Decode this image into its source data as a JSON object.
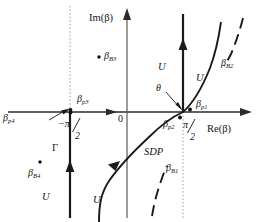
{
  "figure": {
    "axes": {
      "x_label": "Re(β)",
      "y_label": "Im(β)",
      "origin_label": "0"
    },
    "ticks": [
      {
        "name": "minus-pi-over-2",
        "numerator": "−π",
        "slash": "∕",
        "denominator": "2",
        "x": 70,
        "y": 112
      },
      {
        "name": "pi-over-2",
        "numerator": "π",
        "slash": "∕",
        "denominator": "2",
        "x": 183,
        "y": 112
      }
    ],
    "angle_label": "θ",
    "contour_label": "Γ",
    "sdp_label": "SDP",
    "u_labels": [
      {
        "id": "u-upper-left-of-vertical",
        "text": "U",
        "x": 158,
        "y": 55
      },
      {
        "id": "u-right-of-vertical",
        "text": "U",
        "x": 196,
        "y": 73
      },
      {
        "id": "u-lower-left",
        "text": "U",
        "x": 42,
        "y": 197
      },
      {
        "id": "u-lower-right-of-contour",
        "text": "U",
        "x": 93,
        "y": 200
      }
    ],
    "poles": [
      {
        "id": "beta-p1",
        "base": "β",
        "sub": "p1",
        "x": 196,
        "y": 106,
        "dot_x": 189,
        "dot_y": 110
      },
      {
        "id": "beta-p2",
        "base": "β",
        "sub": "p2",
        "x": 165,
        "y": 126,
        "dot_x": 180,
        "dot_y": 117
      },
      {
        "id": "beta-p3",
        "base": "β",
        "sub": "p3",
        "x": 79,
        "y": 101,
        "dot_x": 69,
        "dot_y": 110
      },
      {
        "id": "beta-p4",
        "base": "β",
        "sub": "p4",
        "x": 5,
        "y": 117,
        "dot_x": 70,
        "dot_y": 112
      }
    ],
    "branch_points": [
      {
        "id": "beta-B1",
        "base": "β",
        "sub": "B1",
        "x": 168,
        "y": 170
      },
      {
        "id": "beta-B2",
        "base": "β",
        "sub": "B2",
        "x": 222,
        "y": 64
      },
      {
        "id": "beta-B3",
        "base": "β",
        "sub": "B3",
        "x": 106,
        "y": 57,
        "dot_x": 99,
        "dot_y": 57
      },
      {
        "id": "beta-B4",
        "base": "β",
        "sub": "B4",
        "x": 29,
        "y": 175,
        "dot_x": 40,
        "dot_y": 162
      }
    ],
    "colors": {
      "ink": "#151515",
      "axis": "#2b2b2b",
      "dotted": "#8a8a8a",
      "paper": "#ffffff"
    }
  }
}
